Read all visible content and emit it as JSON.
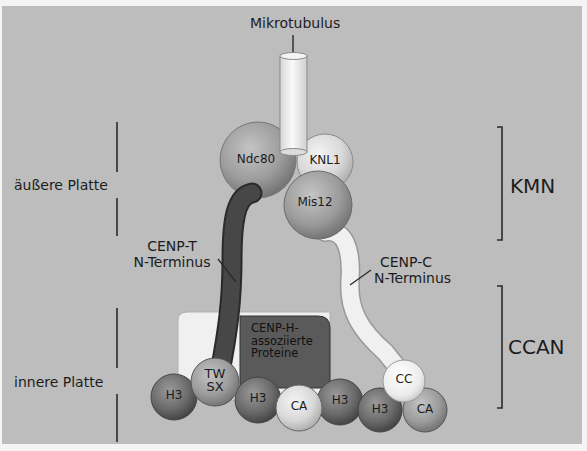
{
  "diagram": {
    "title_label": "Mikrotubulus",
    "left_labels": {
      "outer_plate": "äußere Platte",
      "inner_plate": "innere Platte"
    },
    "right_labels": {
      "kmn": "KMN",
      "ccan": "CCAN"
    },
    "annotations": {
      "cenp_t_line1": "CENP-T",
      "cenp_t_line2": "N-Terminus",
      "cenp_c_line1": "CENP-C",
      "cenp_c_line2": "N-Terminus",
      "cenp_h_line1": "CENP-H-",
      "cenp_h_line2": "assoziierte",
      "cenp_h_line3": "Proteine"
    },
    "kmn_proteins": {
      "ndc80": "Ndc80",
      "knl1": "KNL1",
      "mis12": "Mis12"
    },
    "nucleosomes": [
      {
        "label": "H3"
      },
      {
        "label": "TW\nSX",
        "line1": "TW",
        "line2": "SX"
      },
      {
        "label": "H3"
      },
      {
        "label": "CA"
      },
      {
        "label": "H3"
      },
      {
        "label": "H3"
      },
      {
        "label": "CA"
      }
    ],
    "cc_protein": "CC",
    "colors": {
      "background": "#bdbdbd",
      "cenp_t_strand": "#3a3a3a",
      "cenp_c_strand": "#eeeeee",
      "dark_sphere": "#6e6e6e",
      "light_sphere": "#d8d8d8",
      "cenp_h_box": "#5a5a5a",
      "white_box": "#f0f0f0"
    }
  }
}
